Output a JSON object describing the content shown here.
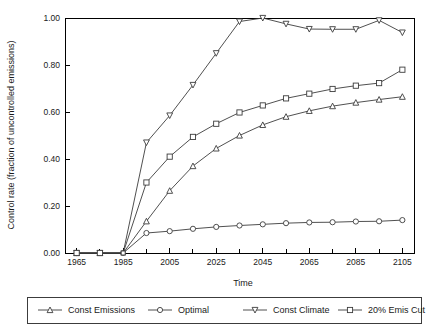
{
  "chart_data": {
    "type": "line",
    "title": "",
    "xlabel": "Time",
    "ylabel": "Control rate (fraction of uncontrolled emissions)",
    "xlim": [
      1960,
      2110
    ],
    "ylim": [
      0.0,
      1.0
    ],
    "grid": false,
    "legend_position": "bottom",
    "x_ticks_major": [
      1965,
      1985,
      2005,
      2025,
      2045,
      2065,
      2085,
      2105
    ],
    "x_tick_labels": [
      "1965",
      "1985",
      "2005",
      "2025",
      "2045",
      "2065",
      "2085",
      "2105"
    ],
    "x_ticks_minor": [
      1975,
      1995,
      2015,
      2035,
      2055,
      2075,
      2095
    ],
    "y_ticks": [
      0.0,
      0.2,
      0.4,
      0.6,
      0.8,
      1.0
    ],
    "y_tick_labels": [
      "0.00",
      "0.20",
      "0.40",
      "0.60",
      "0.80",
      "1.00"
    ],
    "x": [
      1965,
      1975,
      1985,
      1995,
      2005,
      2015,
      2025,
      2035,
      2045,
      2055,
      2065,
      2075,
      2085,
      2095,
      2105
    ],
    "series": [
      {
        "name": "Const Emissions",
        "marker": "triangle-up",
        "values": [
          0.0,
          0.0,
          0.0,
          0.135,
          0.265,
          0.37,
          0.445,
          0.5,
          0.545,
          0.58,
          0.605,
          0.625,
          0.64,
          0.653,
          0.665
        ]
      },
      {
        "name": "Optimal",
        "marker": "circle",
        "values": [
          0.0,
          0.0,
          0.0,
          0.085,
          0.093,
          0.103,
          0.111,
          0.117,
          0.122,
          0.127,
          0.13,
          0.131,
          0.134,
          0.135,
          0.14
        ]
      },
      {
        "name": "Const Climate",
        "marker": "triangle-down",
        "values": [
          0.0,
          0.0,
          0.0,
          0.47,
          0.585,
          0.715,
          0.85,
          0.985,
          1.0,
          0.975,
          0.953,
          0.952,
          0.952,
          0.99,
          0.938
        ]
      },
      {
        "name": "20% Emis Cut",
        "marker": "square",
        "values": [
          0.0,
          0.0,
          0.0,
          0.3,
          0.41,
          0.494,
          0.55,
          0.598,
          0.628,
          0.658,
          0.678,
          0.698,
          0.712,
          0.723,
          0.78
        ]
      }
    ]
  },
  "legend": {
    "items": [
      {
        "label": "Const Emissions",
        "marker": "triangle-up"
      },
      {
        "label": "Optimal",
        "marker": "circle"
      },
      {
        "label": "Const Climate",
        "marker": "triangle-down"
      },
      {
        "label": "20% Emis Cut",
        "marker": "square"
      }
    ]
  },
  "colors": {
    "line": "#3c3c3c",
    "axis": "#000000",
    "text": "#1a1a1a",
    "background": "#ffffff"
  }
}
